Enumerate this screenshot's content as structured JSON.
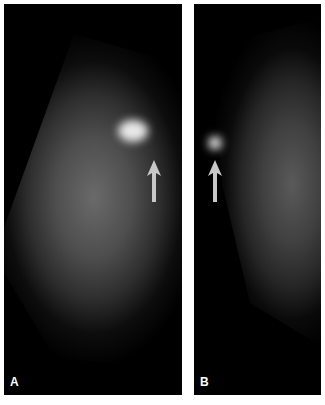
{
  "figure": {
    "panels": [
      {
        "label": "A",
        "description": "mammogram view with bright mass indicated by arrow"
      },
      {
        "label": "B",
        "description": "second mammogram view with mass indicated by arrow"
      }
    ],
    "colors": {
      "background": "#ffffff",
      "panel": "#000000",
      "arrow": "#c8c8c8"
    }
  }
}
